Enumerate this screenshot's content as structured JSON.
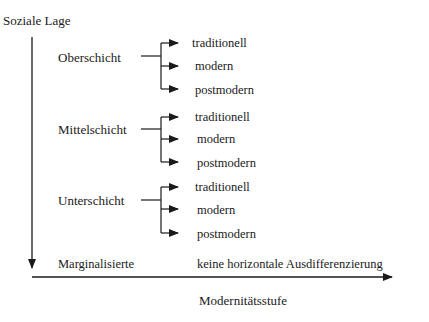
{
  "diagram": {
    "y_axis_label": "Soziale Lage",
    "x_axis_label": "Modernitätsstufe",
    "classes": [
      {
        "name": "Oberschicht",
        "branches": [
          "traditionell",
          "modern",
          "postmodern"
        ]
      },
      {
        "name": "Mittelschicht",
        "branches": [
          "traditionell",
          "modern",
          "postmodern"
        ]
      },
      {
        "name": "Unterschicht",
        "branches": [
          "traditionell",
          "modern",
          "postmodern"
        ]
      }
    ],
    "bottom_row": {
      "name": "Marginalisierte",
      "note": "keine horizontale Ausdifferenzierung"
    },
    "line_color": "#1a1a1a"
  }
}
